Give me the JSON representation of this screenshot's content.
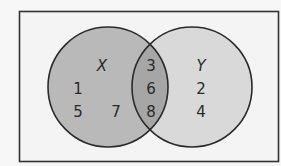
{
  "diagram": {
    "type": "venn",
    "universe": {
      "x": 19.5,
      "y": 11.5,
      "width": 259,
      "height": 150,
      "fill": "#f4f4f4",
      "stroke": "#333333"
    },
    "sets": [
      {
        "id": "X",
        "label": "X",
        "cx": 108,
        "cy": 87,
        "r": 60,
        "fill": "#b9b9b9",
        "label_pos": [
          102,
          70
        ]
      },
      {
        "id": "Y",
        "label": "Y",
        "cx": 192,
        "cy": 87,
        "r": 60,
        "fill": "#d9d9d9",
        "label_pos": [
          201,
          70
        ]
      }
    ],
    "intersection_fill": "#a6a6a6",
    "circle_stroke": "#2b2b2b",
    "regions": {
      "x_only": {
        "elements": [
          {
            "value": "1",
            "x": 78,
            "y": 94
          },
          {
            "value": "5",
            "x": 78,
            "y": 117
          },
          {
            "value": "7",
            "x": 116,
            "y": 117
          }
        ]
      },
      "x_and_y": {
        "elements": [
          {
            "value": "3",
            "x": 151,
            "y": 71
          },
          {
            "value": "6",
            "x": 151,
            "y": 94
          },
          {
            "value": "8",
            "x": 151,
            "y": 117
          }
        ]
      },
      "y_only": {
        "elements": [
          {
            "value": "2",
            "x": 201,
            "y": 94
          },
          {
            "value": "4",
            "x": 201,
            "y": 117
          }
        ]
      }
    }
  },
  "labels": {
    "set_x": "X",
    "set_y": "Y",
    "x_only": [
      "1",
      "5",
      "7"
    ],
    "intersection": [
      "3",
      "6",
      "8"
    ],
    "y_only": [
      "2",
      "4"
    ]
  }
}
